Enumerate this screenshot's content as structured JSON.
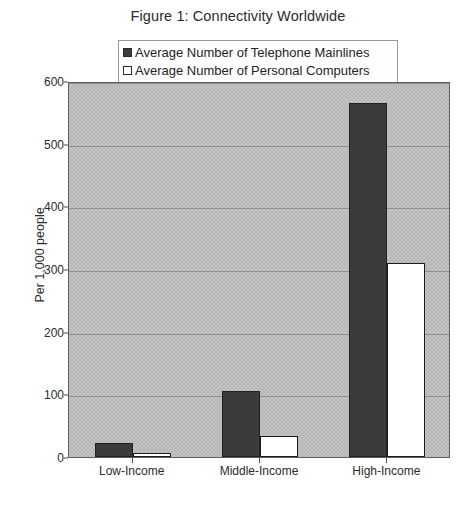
{
  "chart_data": {
    "type": "bar",
    "title": "Figure 1: Connectivity Worldwide",
    "xlabel": "",
    "ylabel": "Per 1,000 people",
    "categories": [
      "Low-Income",
      "Middle-Income",
      "High-Income"
    ],
    "series": [
      {
        "name": "Average Number of Telephone Mainlines",
        "color": "#3b3b3b",
        "values": [
          22,
          105,
          565
        ]
      },
      {
        "name": "Average Number of Personal Computers",
        "color": "#ffffff",
        "values": [
          6,
          34,
          310
        ]
      }
    ],
    "ylim": [
      0,
      600
    ],
    "yticks": [
      0,
      100,
      200,
      300,
      400,
      500,
      600
    ],
    "ytick_labels": [
      "0",
      "100",
      "200",
      "300",
      "400",
      "500",
      "600"
    ],
    "grid": true,
    "legend_position": "top-center",
    "plot_background": "#c3c3c3",
    "border_color": "#5d5d5d"
  },
  "legend": {
    "items": [
      {
        "label": "Average Number of Telephone Mainlines",
        "swatch": "filled-dark-square"
      },
      {
        "label": "Average Number of Personal Computers",
        "swatch": "outlined-white-square"
      }
    ]
  }
}
